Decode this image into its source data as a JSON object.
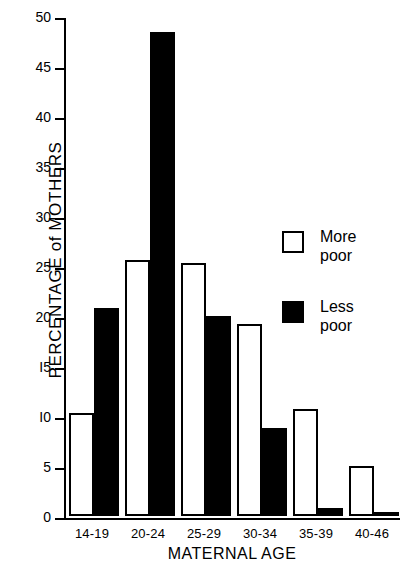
{
  "chart_data": {
    "type": "bar",
    "title": "",
    "xlabel": "MATERNAL  AGE",
    "ylabel": "PERCENTAGE of MOTHERS",
    "categories": [
      "14-19",
      "20-24",
      "25-29",
      "30-34",
      "35-39",
      "40-46"
    ],
    "series": [
      {
        "name": "More poor",
        "style": "open",
        "values": [
          10.3,
          25.6,
          25.3,
          19.2,
          10.7,
          5.0
        ]
      },
      {
        "name": "Less poor",
        "style": "filled",
        "values": [
          20.8,
          48.4,
          20.0,
          8.8,
          0.8,
          0.4
        ]
      }
    ],
    "ylim": [
      0,
      50
    ],
    "yticks": [
      0,
      5,
      10,
      15,
      20,
      25,
      30,
      35,
      40,
      45,
      50
    ],
    "ytick_labels": [
      "0",
      "5",
      "I0",
      "I5",
      "20",
      "25",
      "30",
      "35",
      "40",
      "45",
      "50"
    ],
    "grid": false,
    "legend_position": "center-right"
  },
  "legend": {
    "entries": [
      {
        "label": "More\npoor",
        "swatch": "open-square"
      },
      {
        "label": "Less\npoor",
        "swatch": "filled-square"
      }
    ]
  }
}
